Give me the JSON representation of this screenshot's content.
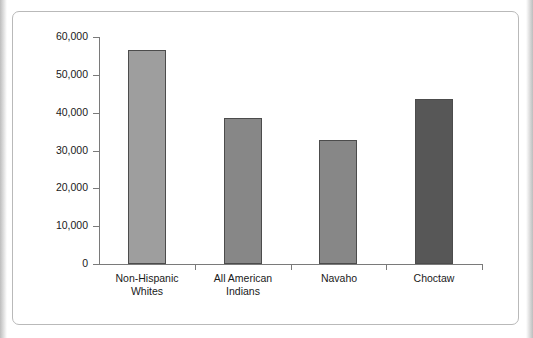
{
  "chart_data": {
    "type": "bar",
    "title": "",
    "subtitle": "",
    "xlabel": "",
    "ylabel": "",
    "categories": [
      "Non-Hispanic\nWhites",
      "All American\nIndians",
      "Navaho",
      "Choctaw"
    ],
    "values": [
      56500,
      38500,
      32700,
      43500
    ],
    "ylim": [
      0,
      60000
    ],
    "ytick_values": [
      0,
      10000,
      20000,
      30000,
      40000,
      50000,
      60000
    ],
    "ytick_labels": [
      "0",
      "10,000",
      "20,000",
      "30,000",
      "40,000",
      "50,000",
      "60,000"
    ],
    "grid": false,
    "legend": false,
    "legend_position": "none",
    "bar_colors": [
      "#9e9e9e",
      "#878787",
      "#878787",
      "#575757"
    ],
    "bar_border_color": "#4c4c4c",
    "axis_color": "#7a7a7a",
    "frame_border_color": "#b9b9b9",
    "background_color": "#ffffff",
    "text_color": "#1a1a1a"
  }
}
